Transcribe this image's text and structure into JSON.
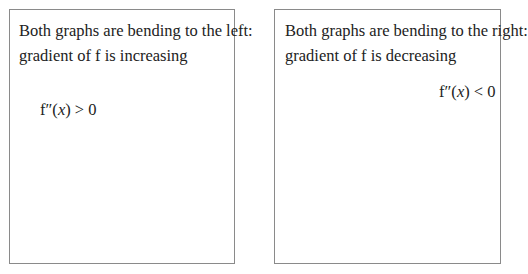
{
  "left_panel": {
    "caption_line1": "Both graphs are bending to the left:",
    "caption_line2": "gradient of f is increasing",
    "formula_prefix": "f″(",
    "formula_var": "x",
    "formula_suffix": ") > 0",
    "curves": [
      {
        "name": "upper-convex-curve",
        "tangent_points": 2
      },
      {
        "name": "lower-convex-curve",
        "tangent_points": 2
      }
    ]
  },
  "right_panel": {
    "caption_line1": "Both graphs are bending to the right:",
    "caption_line2": "gradient of f is decreasing",
    "formula_prefix": "f″(",
    "formula_var": "x",
    "formula_suffix": ") < 0",
    "curves": [
      {
        "name": "upper-concave-curve",
        "tangent_points": 2
      },
      {
        "name": "lower-concave-curve",
        "tangent_points": 2
      }
    ]
  },
  "colors": {
    "stroke": "#1a1a1a",
    "tangent": "#333333",
    "border": "#8a8a8a"
  }
}
